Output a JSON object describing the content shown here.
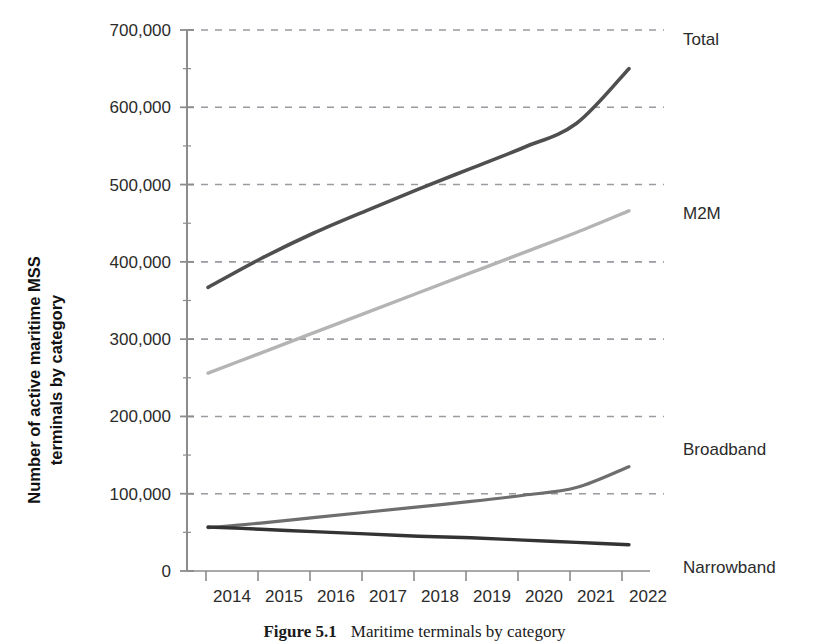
{
  "figure": {
    "caption_label": "Figure 5.1",
    "caption_text": "Maritime terminals by category"
  },
  "chart_data": {
    "type": "line",
    "title": "",
    "xlabel": "",
    "ylabel": "Number of active maritime MSS terminals by category",
    "ylabel_line1": "Number of active maritime MSS",
    "ylabel_line2": "terminals by category",
    "grid": true,
    "grid_style": "dashed-horizontal",
    "legend_position": "right-inline",
    "x": [
      2014,
      2015,
      2016,
      2017,
      2018,
      2019,
      2020,
      2021,
      2022
    ],
    "categories": [
      "2014",
      "2015",
      "2016",
      "2017",
      "2018",
      "2019",
      "2020",
      "2021",
      "2022"
    ],
    "xlim": [
      2013.6,
      2022.4
    ],
    "ylim": [
      0,
      700000
    ],
    "yticks": [
      0,
      100000,
      200000,
      300000,
      400000,
      500000,
      600000,
      700000
    ],
    "ytick_labels": [
      "0",
      "100,000",
      "200,000",
      "300,000",
      "400,000",
      "500,000",
      "600,000",
      "700,000"
    ],
    "series": [
      {
        "name": "Total",
        "color": "#4f4f4f",
        "width": 3.6,
        "values": [
          367000,
          404000,
          437000,
          466000,
          494000,
          521000,
          548000,
          579000,
          650000
        ]
      },
      {
        "name": "M2M",
        "color": "#b4b4b4",
        "width": 3.4,
        "values": [
          256000,
          282000,
          308000,
          334000,
          360000,
          386000,
          412000,
          438000,
          466000
        ]
      },
      {
        "name": "Broadband",
        "color": "#6e6e6e",
        "width": 3.2,
        "values": [
          56000,
          62000,
          69000,
          76000,
          83000,
          90000,
          98000,
          108000,
          135000
        ]
      },
      {
        "name": "Narrowband",
        "color": "#333333",
        "width": 3.4,
        "values": [
          57000,
          54000,
          51000,
          48000,
          45000,
          43000,
          40000,
          37000,
          34000
        ]
      }
    ],
    "axis_color": "#8c8c8c",
    "grid_color": "#9a9aa0"
  }
}
